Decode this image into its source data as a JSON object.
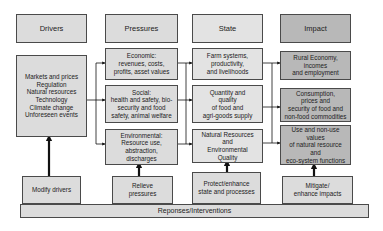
{
  "headers": {
    "drivers": "Drivers",
    "pressures": "Pressures",
    "state": "State",
    "impact": "Impact"
  },
  "drivers_box": "Markets and prices\nRegulation\nNatural resources\nTechnology\nClimate change\nUnforeseen events",
  "pressures": [
    "Economic:\nrevenues, costs,\nprofits, asset values",
    "Social:\nhealth and safety, bio-\nsecurity and food\nsafety, animal welfare",
    "Environmental:\nResource use,\nabstraction,\ndischarges"
  ],
  "state": [
    "Farm systems,\nproductivity,\nand livelihoods",
    "Quantity and\nquality\nof food and\nagri-goods supply",
    "Natural Resources\nand\nEnvironmental\nQuality"
  ],
  "impact": [
    "Rural Economy,\nincomes\nand employment",
    "Consumption,\nprices and\nsecurity of food and\nnon-food commodities",
    "Use and non-use\nvalues\nof natural resource\nand\neco-system functions"
  ],
  "responses": {
    "modify_drivers": "Modify drivers",
    "relieve_pressures": "Relieve\npressures",
    "protect_state": "Protect/enhance\nstate and processes",
    "mitigate_impacts": "Mitigate/\nenhance impacts",
    "bar_label": "Reponses/Interventions"
  },
  "colors": {
    "light_box": "#dcdcdc",
    "dark_box": "#b8b8b8",
    "border": "#4a4a4a",
    "arrow": "#111111"
  }
}
